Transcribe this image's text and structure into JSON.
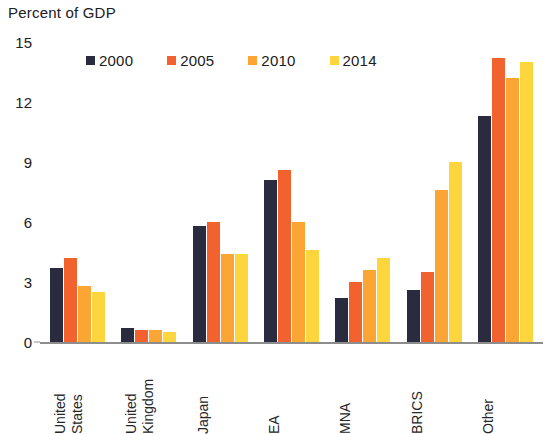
{
  "chart_data": {
    "type": "bar",
    "title": "Percent of GDP",
    "xlabel": "",
    "ylabel": "",
    "ylim": [
      0,
      15
    ],
    "yticks": [
      0,
      3,
      6,
      9,
      12,
      15
    ],
    "ytick_labels": [
      "0",
      "3",
      "6",
      "9",
      "12",
      "15"
    ],
    "grid": false,
    "legend_position": "top",
    "categories": [
      "United States",
      "United Kingdom",
      "Japan",
      "EA",
      "MNA",
      "BRICS",
      "Other"
    ],
    "category_lines": [
      [
        "United",
        "States"
      ],
      [
        "United",
        "Kingdom"
      ],
      [
        "Japan"
      ],
      [
        "EA"
      ],
      [
        "MNA"
      ],
      [
        "BRICS"
      ],
      [
        "Other"
      ]
    ],
    "series": [
      {
        "name": "2000",
        "color": "#2b2b40",
        "values": [
          3.7,
          0.7,
          5.8,
          8.1,
          2.2,
          2.6,
          11.3
        ]
      },
      {
        "name": "2005",
        "color": "#f2622e",
        "values": [
          4.2,
          0.6,
          6.0,
          8.6,
          3.0,
          3.5,
          14.2
        ]
      },
      {
        "name": "2010",
        "color": "#fba634",
        "values": [
          2.8,
          0.6,
          4.4,
          6.0,
          3.6,
          7.6,
          13.2
        ]
      },
      {
        "name": "2014",
        "color": "#fcd63c",
        "values": [
          2.5,
          0.5,
          4.4,
          4.6,
          4.2,
          9.0,
          14.0
        ]
      }
    ]
  },
  "axis": {
    "baseline_color": "#8d8d8d"
  }
}
